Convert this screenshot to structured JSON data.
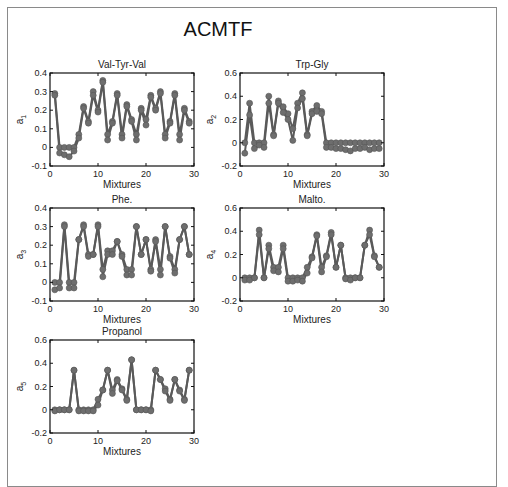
{
  "figure": {
    "title": "ACMTF"
  },
  "chart_data": [
    {
      "type": "line",
      "title": "Val-Tyr-Val",
      "xlabel": "Mixtures",
      "ylabel": "a1",
      "xlim": [
        0,
        30
      ],
      "ylim": [
        -0.1,
        0.4
      ],
      "xticks": [
        0,
        10,
        20,
        30
      ],
      "yticks": [
        -0.1,
        0,
        0.1,
        0.2,
        0.3,
        0.4
      ],
      "grid": false,
      "x": [
        1,
        2,
        3,
        4,
        5,
        6,
        7,
        8,
        9,
        10,
        11,
        12,
        13,
        14,
        15,
        16,
        17,
        18,
        19,
        20,
        21,
        22,
        23,
        24,
        25,
        26,
        27,
        28,
        29
      ],
      "series": [
        {
          "name": "model A",
          "values": [
            0.29,
            0.0,
            0.0,
            0.0,
            0.0,
            0.07,
            0.22,
            0.14,
            0.3,
            0.2,
            0.36,
            0.07,
            0.14,
            0.29,
            0.07,
            0.23,
            0.15,
            0.07,
            0.21,
            0.15,
            0.28,
            0.21,
            0.3,
            0.07,
            0.14,
            0.29,
            0.07,
            0.21,
            0.14
          ]
        },
        {
          "name": "model B",
          "values": [
            0.28,
            -0.03,
            -0.04,
            -0.05,
            -0.02,
            0.05,
            0.21,
            0.13,
            0.28,
            0.19,
            0.35,
            0.04,
            0.13,
            0.28,
            0.05,
            0.22,
            0.14,
            0.04,
            0.2,
            0.12,
            0.27,
            0.2,
            0.29,
            0.05,
            0.13,
            0.28,
            0.04,
            0.2,
            0.13
          ]
        }
      ]
    },
    {
      "type": "line",
      "title": "Trp-Gly",
      "xlabel": "Mixtures",
      "ylabel": "a2",
      "xlim": [
        0,
        30
      ],
      "ylim": [
        -0.2,
        0.6
      ],
      "xticks": [
        0,
        10,
        20,
        30
      ],
      "yticks": [
        -0.2,
        0,
        0.2,
        0.4,
        0.6
      ],
      "grid": false,
      "x": [
        1,
        2,
        3,
        4,
        5,
        6,
        7,
        8,
        9,
        10,
        11,
        12,
        13,
        14,
        15,
        16,
        17,
        18,
        19,
        20,
        21,
        22,
        23,
        24,
        25,
        26,
        27,
        28,
        29
      ],
      "series": [
        {
          "name": "model A",
          "values": [
            0.0,
            0.34,
            0.0,
            0.0,
            0.0,
            0.4,
            0.07,
            0.36,
            0.31,
            0.25,
            0.12,
            0.34,
            0.43,
            0.07,
            0.27,
            0.32,
            0.27,
            0.0,
            0.0,
            0.0,
            0.0,
            0.0,
            0.0,
            0.0,
            0.0,
            0.0,
            0.0,
            0.0,
            0.0
          ]
        },
        {
          "name": "model B",
          "values": [
            -0.09,
            0.24,
            -0.05,
            -0.02,
            -0.04,
            0.34,
            0.06,
            0.34,
            0.26,
            0.2,
            0.02,
            0.3,
            0.38,
            0.06,
            0.25,
            0.27,
            0.25,
            -0.04,
            -0.04,
            -0.05,
            -0.05,
            -0.06,
            -0.07,
            -0.05,
            -0.05,
            -0.04,
            -0.06,
            -0.05,
            -0.05
          ]
        }
      ]
    },
    {
      "type": "line",
      "title": "Phe.",
      "xlabel": "Mixtures",
      "ylabel": "a3",
      "xlim": [
        0,
        30
      ],
      "ylim": [
        -0.1,
        0.4
      ],
      "xticks": [
        0,
        10,
        20,
        30
      ],
      "yticks": [
        -0.1,
        0,
        0.1,
        0.2,
        0.3,
        0.4
      ],
      "grid": false,
      "x": [
        1,
        2,
        3,
        4,
        5,
        6,
        7,
        8,
        9,
        10,
        11,
        12,
        13,
        14,
        15,
        16,
        17,
        18,
        19,
        20,
        21,
        22,
        23,
        24,
        25,
        26,
        27,
        28,
        29
      ],
      "series": [
        {
          "name": "model A",
          "values": [
            0.0,
            0.0,
            0.31,
            0.0,
            0.0,
            0.23,
            0.31,
            0.15,
            0.15,
            0.31,
            0.07,
            0.17,
            0.17,
            0.22,
            0.15,
            0.07,
            0.07,
            0.3,
            0.15,
            0.23,
            0.07,
            0.23,
            0.07,
            0.3,
            0.14,
            0.07,
            0.23,
            0.3,
            0.15
          ]
        },
        {
          "name": "model B",
          "values": [
            -0.04,
            -0.03,
            0.3,
            -0.03,
            -0.03,
            0.23,
            0.3,
            0.14,
            0.15,
            0.3,
            0.03,
            0.15,
            0.15,
            0.22,
            0.14,
            0.04,
            0.04,
            0.3,
            0.15,
            0.23,
            0.06,
            0.22,
            0.04,
            0.3,
            0.13,
            0.05,
            0.23,
            0.3,
            0.15
          ]
        }
      ]
    },
    {
      "type": "line",
      "title": "Malto.",
      "xlabel": "Mixtures",
      "ylabel": "a4",
      "xlim": [
        0,
        30
      ],
      "ylim": [
        -0.2,
        0.6
      ],
      "xticks": [
        0,
        10,
        20,
        30
      ],
      "yticks": [
        -0.2,
        0,
        0.2,
        0.4,
        0.6
      ],
      "grid": false,
      "x": [
        1,
        2,
        3,
        4,
        5,
        6,
        7,
        8,
        9,
        10,
        11,
        12,
        13,
        14,
        15,
        16,
        17,
        18,
        19,
        20,
        21,
        22,
        23,
        24,
        25,
        26,
        27,
        28,
        29
      ],
      "series": [
        {
          "name": "model A",
          "values": [
            0.0,
            0.0,
            0.0,
            0.41,
            0.0,
            0.28,
            0.09,
            0.09,
            0.28,
            0.0,
            0.0,
            0.0,
            0.0,
            0.09,
            0.18,
            0.37,
            0.09,
            0.19,
            0.39,
            0.09,
            0.28,
            0.0,
            0.0,
            0.0,
            0.0,
            0.28,
            0.41,
            0.19,
            0.09
          ]
        },
        {
          "name": "model B",
          "values": [
            -0.02,
            -0.02,
            0.0,
            0.37,
            0.0,
            0.25,
            0.06,
            0.05,
            0.25,
            -0.03,
            -0.03,
            -0.02,
            -0.03,
            0.04,
            0.17,
            0.36,
            0.05,
            0.18,
            0.37,
            0.09,
            0.28,
            -0.01,
            -0.02,
            0.0,
            0.0,
            0.28,
            0.37,
            0.18,
            0.09
          ]
        }
      ]
    },
    {
      "type": "line",
      "title": "Propanol",
      "xlabel": "Mixtures",
      "ylabel": "a5",
      "xlim": [
        0,
        30
      ],
      "ylim": [
        -0.2,
        0.6
      ],
      "xticks": [
        0,
        10,
        20,
        30
      ],
      "yticks": [
        -0.2,
        0,
        0.2,
        0.4,
        0.6
      ],
      "grid": false,
      "x": [
        1,
        2,
        3,
        4,
        5,
        6,
        7,
        8,
        9,
        10,
        11,
        12,
        13,
        14,
        15,
        16,
        17,
        18,
        19,
        20,
        21,
        22,
        23,
        24,
        25,
        26,
        27,
        28,
        29
      ],
      "series": [
        {
          "name": "model A",
          "values": [
            0.0,
            0.0,
            0.0,
            0.0,
            0.34,
            0.0,
            0.0,
            0.0,
            0.0,
            0.09,
            0.17,
            0.34,
            0.17,
            0.26,
            0.18,
            0.09,
            0.43,
            0.0,
            0.0,
            0.0,
            0.0,
            0.34,
            0.26,
            0.18,
            0.09,
            0.26,
            0.17,
            0.09,
            0.34
          ]
        },
        {
          "name": "model B",
          "values": [
            -0.01,
            0.0,
            0.0,
            0.0,
            0.34,
            -0.01,
            -0.01,
            -0.01,
            -0.01,
            0.04,
            0.17,
            0.34,
            0.14,
            0.25,
            0.17,
            0.08,
            0.43,
            0.0,
            0.0,
            0.0,
            -0.01,
            0.34,
            0.26,
            0.16,
            0.08,
            0.26,
            0.16,
            0.08,
            0.34
          ]
        }
      ]
    }
  ],
  "style": {
    "line_color": "#5a5a5a",
    "marker_color": "#6e6e6e",
    "axis_color": "#111111",
    "frame_color": "#8a8a8a"
  }
}
